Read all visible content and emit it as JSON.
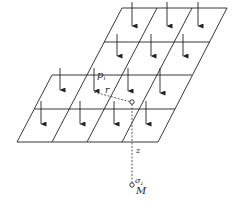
{
  "diagram": {
    "labels": {
      "load_point": "p",
      "load_point_sub": "i",
      "radius": "r",
      "depth": "z",
      "stress": "σ",
      "stress_sub": "z",
      "point": "M"
    },
    "colors": {
      "line": "#222222",
      "background": "#ffffff"
    },
    "grid": {
      "rows": 4,
      "cols": 4,
      "arrow_direction": "down"
    }
  }
}
